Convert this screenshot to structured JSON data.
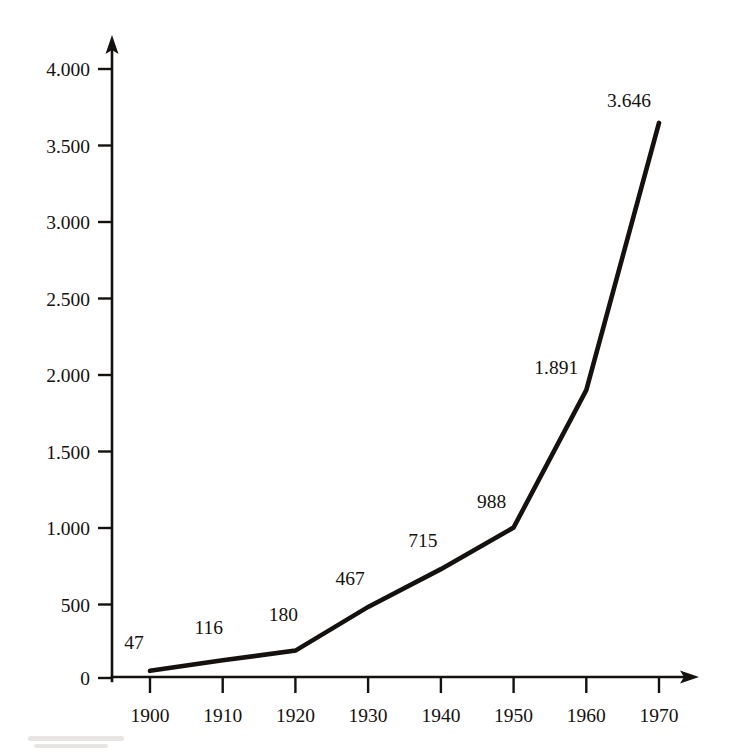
{
  "chart_data": {
    "type": "line",
    "title": "",
    "subtitle": "",
    "xlabel": "",
    "ylabel": "",
    "x": [
      1900,
      1910,
      1920,
      1930,
      1940,
      1950,
      1960,
      1970
    ],
    "categories": [
      "1900",
      "1910",
      "1920",
      "1930",
      "1940",
      "1950",
      "1960",
      "1970"
    ],
    "values": [
      47,
      116,
      180,
      467,
      715,
      988,
      1891,
      3646
    ],
    "point_labels": [
      "47",
      "116",
      "180",
      "467",
      "715",
      "988",
      "1.891",
      "3.646"
    ],
    "series": [
      {
        "name": "",
        "values": [
          47,
          116,
          180,
          467,
          715,
          988,
          1891,
          3646
        ]
      }
    ],
    "xlim": [
      1900,
      1970
    ],
    "ylim": [
      0,
      4000
    ],
    "ytick_values": [
      0,
      500,
      1000,
      1500,
      2000,
      2500,
      3000,
      3500,
      4000
    ],
    "ytick_labels": [
      "0",
      "500",
      "1.000",
      "1.500",
      "2.000",
      "2.500",
      "3.000",
      "3.500",
      "4.000"
    ],
    "xtick_labels": [
      "1900",
      "1910",
      "1920",
      "1930",
      "1940",
      "1950",
      "1960",
      "1970"
    ],
    "grid": false,
    "legend": false,
    "legend_position": "none",
    "line_color": "#14110f",
    "background_color": "#ffffff",
    "axis_color": "#14110f",
    "thousands_separator": ".",
    "axis_arrows": true,
    "markers": false,
    "annotations": []
  },
  "axes": {
    "y_axis_name": "value-axis",
    "x_axis_name": "year-axis"
  }
}
